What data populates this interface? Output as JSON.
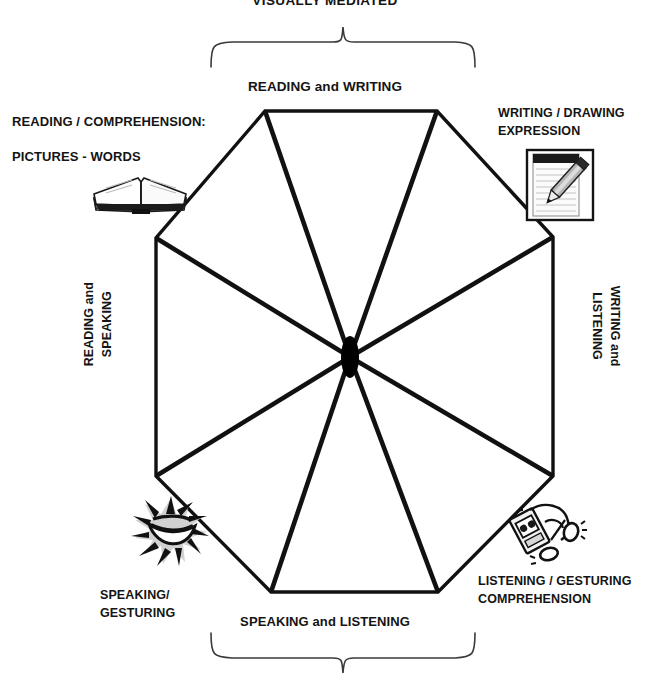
{
  "diagram": {
    "title": "VISUALLY MEDIATED",
    "type": "octagon-umbrella-communication-modes",
    "panels": {
      "top": "READING and WRITING",
      "bottom": "SPEAKING and LISTENING",
      "left_line1": "READING and",
      "left_line2": "SPEAKING",
      "right_line1": "WRITING and",
      "right_line2": "LISTENING"
    },
    "corners": {
      "top_left_line1": "READING / COMPREHENSION:",
      "top_left_line2": "PICTURES - WORDS",
      "top_right_line1": "WRITING / DRAWING",
      "top_right_line2": "EXPRESSION",
      "bottom_left_line1": "SPEAKING/",
      "bottom_left_line2": "GESTURING",
      "bottom_right_line1": "LISTENING / GESTURING",
      "bottom_right_line2": "COMPREHENSION"
    },
    "icons": {
      "top_left": "open-book-icon",
      "top_right": "notepad-pencil-icon",
      "bottom_left": "speaking-mouth-burst-icon",
      "bottom_right": "headphones-player-icon"
    },
    "braces": {
      "top": "top-brace-visually-mediated",
      "bottom": "bottom-brace-speaking-listening"
    },
    "colors": {
      "stroke": "#111111",
      "text": "#141414",
      "background": "#ffffff",
      "brace": "#3a3a3a",
      "hub": "#000000"
    }
  }
}
